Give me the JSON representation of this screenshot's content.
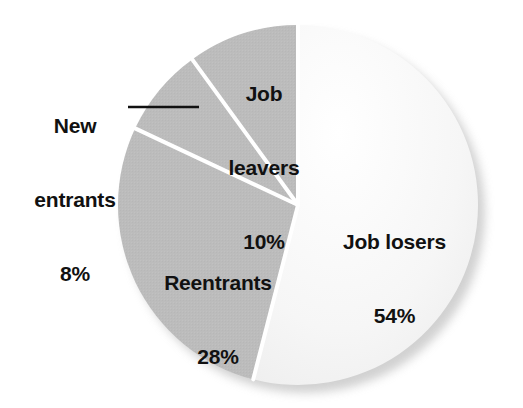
{
  "chart_data": {
    "type": "pie",
    "title": "",
    "subtitle": "",
    "xlabel": "",
    "ylabel": "",
    "unit": "percent",
    "total": 100,
    "start_angle_deg": 0,
    "direction": "clockwise",
    "grid": false,
    "legend": "none",
    "labels_inside": true,
    "categories": [
      "Job losers",
      "Reentrants",
      "New entrants",
      "Job leavers"
    ],
    "values": [
      54,
      28,
      8,
      10
    ],
    "slices": [
      {
        "name": "Job losers",
        "label": "Job losers",
        "value": 54,
        "value_text": "54%",
        "color": "#f5f5f5",
        "start_deg": 0,
        "end_deg": 194.4,
        "label_placement": "inside"
      },
      {
        "name": "Reentrants",
        "label": "Reentrants",
        "value": 28,
        "value_text": "28%",
        "color": "#bcbcbc",
        "start_deg": 194.4,
        "end_deg": 295.2,
        "label_placement": "inside"
      },
      {
        "name": "New entrants",
        "label": "New entrants",
        "value": 8,
        "value_text": "8%",
        "color": "#bcbcbc",
        "start_deg": 295.2,
        "end_deg": 324.0,
        "label_placement": "outside-leader-line"
      },
      {
        "name": "Job leavers",
        "label": "Job leavers",
        "value": 10,
        "value_text": "10%",
        "color": "#bcbcbc",
        "start_deg": 324.0,
        "end_deg": 360.0,
        "label_placement": "inside"
      }
    ],
    "annotations": [
      {
        "name": "new-entrants-leader-line",
        "for": "New entrants",
        "x1": 128,
        "y1": 107,
        "x2": 199,
        "y2": 107
      }
    ]
  },
  "labels": {
    "job_losers": {
      "name": "Job losers",
      "pct": "54%"
    },
    "reentrants": {
      "name": "Reentrants",
      "pct": "28%"
    },
    "new_entrants": {
      "name_line1": "New",
      "name_line2": "entrants",
      "pct": "8%"
    },
    "job_leavers": {
      "name_line1": "Job",
      "name_line2": "leavers",
      "pct": "10%"
    }
  },
  "colors": {
    "background": "#ffffff",
    "slice_light": "#f5f5f5",
    "slice_gray": "#bcbcbc",
    "separator": "#ffffff",
    "text": "#111111",
    "shadow": "#c9c9c9",
    "leader_line": "#111111"
  },
  "geometry": {
    "center_x": 298,
    "center_y": 205,
    "radius": 180,
    "shadow_offset_x": 7,
    "shadow_offset_y": 8,
    "separator_width": 4
  }
}
